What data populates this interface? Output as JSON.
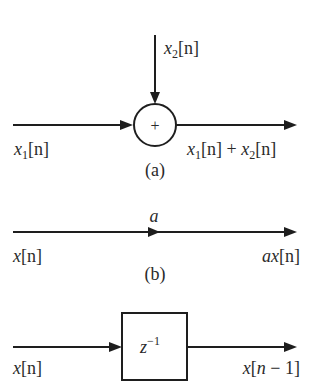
{
  "colors": {
    "stroke": "#1e1e1e",
    "text": "#2a2a2a",
    "background": "#ffffff"
  },
  "diagram_a": {
    "caption": "(a)",
    "adder_symbol": "+",
    "input1": {
      "var": "x",
      "sub": "1",
      "arg": "[n]"
    },
    "input2": {
      "var": "x",
      "sub": "2",
      "arg": "[n]"
    },
    "output": {
      "t1_var": "x",
      "t1_sub": "1",
      "t1_arg": "[n]",
      "op": " + ",
      "t2_var": "x",
      "t2_sub": "2",
      "t2_arg": "[n]"
    }
  },
  "diagram_b": {
    "caption": "(b)",
    "gain": "a",
    "input": {
      "var": "x",
      "arg": "[n]"
    },
    "output": {
      "coef": "a",
      "var": "x",
      "arg": "[n]"
    }
  },
  "diagram_c": {
    "block": {
      "var": "z",
      "exp": "−1"
    },
    "input": {
      "var": "x",
      "arg": "[n]"
    },
    "output": {
      "var": "x",
      "arg_open": "[",
      "n": "n",
      "minus": " − 1",
      "arg_close": "]"
    }
  }
}
